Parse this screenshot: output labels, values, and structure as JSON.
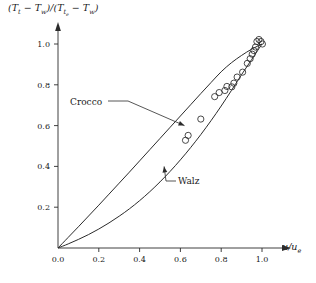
{
  "chart_data": {
    "type": "line",
    "title": "",
    "subtitle": "",
    "xlabel": "u/u_e",
    "ylabel": "(T_t - T_w)/(T_{t_e} - T_w)",
    "xlim": [
      0.0,
      1.05
    ],
    "ylim": [
      0.0,
      1.08
    ],
    "grid": false,
    "legend_position": "inline-annotations",
    "xticks": [
      "0.0",
      "0.2",
      "0.4",
      "0.6",
      "0.8",
      "1.0"
    ],
    "xtick_values": [
      0.0,
      0.2,
      0.4,
      0.6,
      0.8,
      1.0
    ],
    "yticks": [
      "0.0",
      "0.2",
      "0.4",
      "0.6",
      "0.8",
      "1.0"
    ],
    "ytick_values": [
      0.0,
      0.2,
      0.4,
      0.6,
      0.8,
      1.0
    ],
    "annotations": [
      {
        "text": "Crocco",
        "target_x": 0.62,
        "target_y": 0.6
      },
      {
        "text": "Walz",
        "target_x": 0.52,
        "target_y": 0.4
      }
    ],
    "series": [
      {
        "name": "Crocco",
        "style": "line",
        "x": [
          0.0,
          0.05,
          0.1,
          0.15,
          0.2,
          0.25,
          0.3,
          0.35,
          0.4,
          0.45,
          0.5,
          0.55,
          0.6,
          0.65,
          0.7,
          0.75,
          0.8,
          0.85,
          0.9,
          0.95,
          1.0
        ],
        "values": [
          0.0,
          0.052,
          0.104,
          0.157,
          0.21,
          0.264,
          0.318,
          0.372,
          0.427,
          0.482,
          0.537,
          0.592,
          0.647,
          0.702,
          0.757,
          0.811,
          0.864,
          0.908,
          0.944,
          0.975,
          1.0
        ]
      },
      {
        "name": "Walz",
        "style": "line",
        "x": [
          0.0,
          0.05,
          0.1,
          0.15,
          0.2,
          0.25,
          0.3,
          0.35,
          0.4,
          0.45,
          0.5,
          0.55,
          0.6,
          0.65,
          0.7,
          0.75,
          0.8,
          0.85,
          0.9,
          0.95,
          1.0
        ],
        "values": [
          0.0,
          0.02,
          0.042,
          0.066,
          0.093,
          0.123,
          0.156,
          0.192,
          0.232,
          0.276,
          0.324,
          0.376,
          0.432,
          0.492,
          0.556,
          0.624,
          0.696,
          0.772,
          0.85,
          0.925,
          1.0
        ]
      },
      {
        "name": "measurements",
        "style": "scatter",
        "marker": "open-circle",
        "x": [
          0.625,
          0.638,
          0.7,
          0.768,
          0.79,
          0.818,
          0.828,
          0.852,
          0.862,
          0.878,
          0.905,
          0.928,
          0.942,
          0.952,
          0.96,
          0.968,
          0.975,
          0.985,
          0.995,
          1.002
        ],
        "values": [
          0.528,
          0.552,
          0.632,
          0.742,
          0.762,
          0.772,
          0.792,
          0.79,
          0.808,
          0.838,
          0.862,
          0.905,
          0.928,
          0.95,
          0.968,
          0.985,
          1.012,
          1.022,
          1.012,
          1.0
        ]
      }
    ]
  },
  "axis": {
    "ylabel_numer_T": "T",
    "ylabel_numer_sub1": "t",
    "ylabel_minus": "−",
    "ylabel_Tw": "T",
    "ylabel_w": "w",
    "xlabel_u": "u",
    "xlabel_slash": "/",
    "xlabel_ue": "u",
    "xlabel_e": "e"
  },
  "labels": {
    "crocco": "Crocco",
    "walz": "Walz"
  }
}
